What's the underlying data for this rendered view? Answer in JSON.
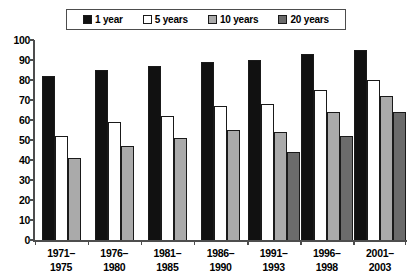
{
  "chart_data": {
    "type": "bar",
    "title": "",
    "subtitle": "",
    "xlabel": "",
    "ylabel": "",
    "ylim": [
      0,
      100
    ],
    "yticks": [
      0,
      10,
      20,
      30,
      40,
      50,
      60,
      70,
      80,
      90,
      100
    ],
    "grid": false,
    "legend_position": "top",
    "categories": [
      "1971–1975",
      "1976–1980",
      "1981–1985",
      "1986–1990",
      "1991–1993",
      "1996–1998",
      "2001–2003"
    ],
    "category_lines": [
      [
        "1971–",
        "1975"
      ],
      [
        "1976–",
        "1980"
      ],
      [
        "1981–",
        "1985"
      ],
      [
        "1986–",
        "1990"
      ],
      [
        "1991–",
        "1993"
      ],
      [
        "1996–",
        "1998"
      ],
      [
        "2001–",
        "2003"
      ]
    ],
    "series": [
      {
        "name": "1 year",
        "color": "#111111",
        "values": [
          82,
          85,
          87,
          89,
          90,
          93,
          95
        ]
      },
      {
        "name": "5 years",
        "color": "#ffffff",
        "values": [
          52,
          59,
          62,
          67,
          68,
          75,
          80
        ]
      },
      {
        "name": "10 years",
        "color": "#aaaaaa",
        "values": [
          41,
          47,
          51,
          55,
          54,
          64,
          72
        ]
      },
      {
        "name": "20 years",
        "color": "#6b6b6b",
        "values": [
          null,
          null,
          null,
          null,
          44,
          52,
          64
        ]
      }
    ]
  },
  "legend": {
    "items": [
      {
        "label": "1 year",
        "swatch": "#111111",
        "icon": "legend-swatch-black"
      },
      {
        "label": "5 years",
        "swatch": "#ffffff",
        "icon": "legend-swatch-white"
      },
      {
        "label": "10 years",
        "swatch": "#aaaaaa",
        "icon": "legend-swatch-light-gray"
      },
      {
        "label": "20 years",
        "swatch": "#6b6b6b",
        "icon": "legend-swatch-dark-gray"
      }
    ]
  },
  "axis": {
    "y_tick_labels": [
      "100",
      "90",
      "80",
      "70",
      "60",
      "50",
      "40",
      "30",
      "20",
      "10",
      "0"
    ]
  },
  "colors": {
    "axis": "#4d4d4d",
    "bar_outline": "#1a1a1a",
    "background": "#ffffff",
    "text": "#000000"
  }
}
